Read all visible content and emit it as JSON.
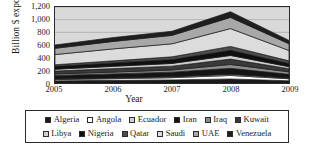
{
  "chart_data": {
    "type": "area",
    "stacked": true,
    "title": "",
    "xlabel": "Year",
    "ylabel": "Billion $ export",
    "categories": [
      "2005",
      "2006",
      "2007",
      "2008",
      "2009"
    ],
    "x": [
      2005,
      2006,
      2007,
      2008,
      2009
    ],
    "ylim": [
      0,
      1200
    ],
    "yticks": [
      "0",
      "200",
      "400",
      "600",
      "800",
      "1,000",
      "1,200"
    ],
    "ytick_values": [
      0,
      200,
      400,
      600,
      800,
      1000,
      1200
    ],
    "grid": true,
    "legend_position": "bottom",
    "plot_background": "#d9d9d9",
    "series": [
      {
        "name": "Algeria",
        "color": "#1a1a1a",
        "values": [
          34,
          42,
          49,
          64,
          35
        ]
      },
      {
        "name": "Angola",
        "color": "#ffffff",
        "values": [
          19,
          26,
          35,
          55,
          32
        ]
      },
      {
        "name": "Ecuador",
        "color": "#d0d0d0",
        "values": [
          10,
          12,
          13,
          18,
          10
        ]
      },
      {
        "name": "Iran",
        "color": "#141414",
        "values": [
          56,
          63,
          74,
          95,
          60
        ]
      },
      {
        "name": "Iraq",
        "color": "#8c8c8c",
        "values": [
          24,
          29,
          35,
          61,
          39
        ]
      },
      {
        "name": "Kuwait",
        "color": "#3a3a3a",
        "values": [
          45,
          55,
          60,
          84,
          50
        ]
      },
      {
        "name": "Libya",
        "color": "#cfcfcf",
        "values": [
          29,
          36,
          43,
          58,
          32
        ]
      },
      {
        "name": "Nigeria",
        "color": "#101010",
        "values": [
          46,
          54,
          62,
          81,
          50
        ]
      },
      {
        "name": "Qatar",
        "color": "#4d4d4d",
        "values": [
          25,
          33,
          42,
          62,
          42
        ]
      },
      {
        "name": "Saudi",
        "color": "#dcdcdc",
        "values": [
          161,
          189,
          206,
          281,
          163
        ]
      },
      {
        "name": "UAE",
        "color": "#a8a8a8",
        "values": [
          99,
          118,
          133,
          177,
          106
        ]
      },
      {
        "name": "Venezuela",
        "color": "#1f1f1f",
        "values": [
          52,
          61,
          65,
          89,
          54
        ]
      }
    ]
  },
  "axes": {
    "ylabel": "Billion $ export",
    "xlabel": "Year"
  },
  "legend": {
    "rows": [
      [
        {
          "label": "Algeria",
          "swatch": "#1a1a1a"
        },
        {
          "label": "Angola",
          "swatch": "#ffffff"
        },
        {
          "label": "Ecuador",
          "swatch": "#d0d0d0"
        },
        {
          "label": "Iran",
          "swatch": "#141414"
        },
        {
          "label": "Iraq",
          "swatch": "#8c8c8c"
        },
        {
          "label": "Kuwait",
          "swatch": "#3a3a3a"
        }
      ],
      [
        {
          "label": "Libya",
          "swatch": "#cfcfcf"
        },
        {
          "label": "Nigeria",
          "swatch": "#101010"
        },
        {
          "label": "Qatar",
          "swatch": "#4d4d4d"
        },
        {
          "label": "Saudi",
          "swatch": "#dcdcdc"
        },
        {
          "label": "UAE",
          "swatch": "#a8a8a8"
        },
        {
          "label": "Venezuela",
          "swatch": "#1f1f1f"
        }
      ]
    ]
  }
}
